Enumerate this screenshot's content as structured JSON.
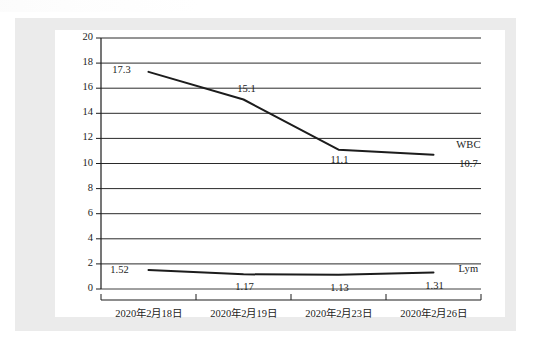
{
  "figure": {
    "background_color": "#ffffff",
    "frame_color": "#ebebeb",
    "panel_color": "#ffffff",
    "axis_color": "#1c1c1c",
    "gridline_color": "#2a2a2a"
  },
  "chart_data": {
    "type": "line",
    "title": "",
    "xlabel": "",
    "ylabel": "",
    "ylim": [
      0,
      20
    ],
    "ytick_step": 2,
    "yticks": [
      "0",
      "2",
      "4",
      "6",
      "8",
      "10",
      "12",
      "14",
      "16",
      "18",
      "20"
    ],
    "grid": "horizontal",
    "legend_position": "inline-right-end-labels",
    "categories": [
      "2020年2月18日",
      "2020年2月19日",
      "2020年2月23日",
      "2020年2月26日"
    ],
    "series": [
      {
        "name": "WBC",
        "color": "#1c1c1c",
        "values": [
          17.3,
          15.1,
          11.1,
          10.7
        ],
        "point_labels": [
          "17.3",
          "15.1",
          "11.1",
          "10.7"
        ],
        "end_label": "WBC"
      },
      {
        "name": "Lym",
        "color": "#1c1c1c",
        "values": [
          1.52,
          1.17,
          1.13,
          1.31
        ],
        "point_labels": [
          "1.52",
          "1.17",
          "1.13",
          "1.31"
        ],
        "end_label": "Lym"
      }
    ]
  }
}
